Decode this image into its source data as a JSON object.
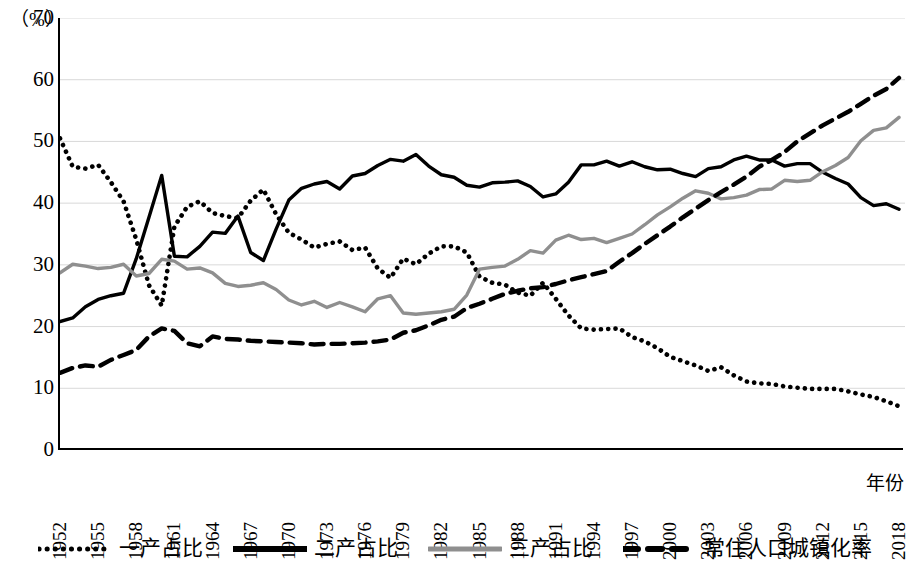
{
  "axis": {
    "unit_label": "（%）",
    "x_title": "年份",
    "y_ticks": [
      "0",
      "10",
      "20",
      "30",
      "40",
      "50",
      "60",
      "70"
    ],
    "x_ticks": [
      "1952",
      "1955",
      "1958",
      "1961",
      "1964",
      "1967",
      "1970",
      "1973",
      "1976",
      "1979",
      "1982",
      "1985",
      "1988",
      "1991",
      "1994",
      "1997",
      "2000",
      "2003",
      "2006",
      "2009",
      "2012",
      "2015",
      "2018"
    ]
  },
  "legend": {
    "items": [
      {
        "label": "一产占比",
        "style": "dotted",
        "color": "#000000"
      },
      {
        "label": "二产占比",
        "style": "solid",
        "color": "#000000"
      },
      {
        "label": "三产占比",
        "style": "solid",
        "color": "#8f8f8f"
      },
      {
        "label": "常住人口城镇化率",
        "style": "dashed",
        "color": "#000000"
      }
    ]
  },
  "chart_data": {
    "type": "line",
    "title": "",
    "xlabel": "年份",
    "ylabel": "（%）",
    "xlim": [
      1952,
      2018
    ],
    "ylim": [
      0,
      70
    ],
    "ytick_step": 10,
    "xtick_step": 3,
    "grid": true,
    "legend_position": "bottom",
    "x": [
      1952,
      1953,
      1954,
      1955,
      1956,
      1957,
      1958,
      1959,
      1960,
      1961,
      1962,
      1963,
      1964,
      1965,
      1966,
      1967,
      1968,
      1969,
      1970,
      1971,
      1972,
      1973,
      1974,
      1975,
      1976,
      1977,
      1978,
      1979,
      1980,
      1981,
      1982,
      1983,
      1984,
      1985,
      1986,
      1987,
      1988,
      1989,
      1990,
      1991,
      1992,
      1993,
      1994,
      1995,
      1996,
      1997,
      1998,
      1999,
      2000,
      2001,
      2002,
      2003,
      2004,
      2005,
      2006,
      2007,
      2008,
      2009,
      2010,
      2011,
      2012,
      2013,
      2014,
      2015,
      2016,
      2017,
      2018
    ],
    "series": [
      {
        "name": "一产占比",
        "style": "dotted",
        "color": "#000000",
        "values": [
          50.5,
          45.9,
          45.6,
          46.2,
          43.4,
          40.3,
          34.1,
          26.7,
          23.4,
          36.2,
          39.4,
          40.3,
          38.4,
          37.9,
          37.6,
          40.4,
          42.2,
          38.2,
          35.2,
          34.1,
          32.8,
          33.4,
          33.8,
          32.4,
          32.8,
          29.4,
          27.9,
          31.0,
          30.1,
          31.8,
          33.0,
          33.0,
          32.0,
          28.1,
          27.1,
          26.8,
          25.5,
          25.0,
          27.1,
          24.5,
          21.8,
          19.7,
          19.5,
          19.6,
          19.7,
          18.3,
          17.6,
          16.5,
          15.1,
          14.4,
          13.7,
          12.8,
          13.4,
          12.1,
          11.1,
          10.8,
          10.7,
          10.3,
          10.1,
          9.9,
          9.9,
          9.9,
          9.5,
          9.0,
          8.6,
          7.9,
          7.1
        ]
      },
      {
        "name": "二产占比",
        "style": "solid",
        "color": "#000000",
        "values": [
          20.8,
          21.4,
          23.2,
          24.4,
          25.0,
          25.4,
          31.0,
          37.7,
          44.5,
          31.4,
          31.3,
          33.0,
          35.3,
          35.1,
          37.9,
          32.0,
          30.7,
          35.8,
          40.5,
          42.4,
          43.1,
          43.5,
          42.3,
          44.4,
          44.8,
          46.1,
          47.1,
          46.8,
          47.9,
          46.0,
          44.6,
          44.2,
          42.9,
          42.6,
          43.3,
          43.4,
          43.6,
          42.7,
          41.0,
          41.5,
          43.4,
          46.2,
          46.2,
          46.8,
          46.0,
          46.7,
          45.9,
          45.4,
          45.5,
          44.8,
          44.3,
          45.6,
          45.9,
          47.0,
          47.6,
          47.0,
          47.0,
          46.0,
          46.4,
          46.4,
          45.0,
          44.0,
          43.1,
          40.9,
          39.6,
          39.9,
          39.0
        ]
      },
      {
        "name": "三产占比",
        "style": "solid",
        "color": "#8f8f8f",
        "values": [
          28.7,
          30.1,
          29.8,
          29.4,
          29.6,
          30.1,
          28.2,
          28.6,
          30.9,
          30.6,
          29.3,
          29.5,
          28.7,
          27.0,
          26.5,
          26.7,
          27.1,
          26.0,
          24.3,
          23.5,
          24.1,
          23.1,
          23.9,
          23.2,
          22.4,
          24.5,
          25.0,
          22.2,
          22.0,
          22.2,
          22.4,
          22.8,
          25.1,
          29.3,
          29.6,
          29.8,
          30.9,
          32.3,
          31.9,
          34.0,
          34.8,
          34.1,
          34.3,
          33.6,
          34.3,
          35.0,
          36.5,
          38.1,
          39.4,
          40.8,
          42.0,
          41.6,
          40.7,
          40.9,
          41.3,
          42.2,
          42.3,
          43.7,
          43.5,
          43.7,
          45.1,
          46.1,
          47.4,
          50.1,
          51.8,
          52.2,
          53.9
        ]
      },
      {
        "name": "常住人口城镇化率",
        "style": "dashed",
        "color": "#000000",
        "values": [
          12.5,
          13.3,
          13.7,
          13.5,
          14.6,
          15.4,
          16.2,
          18.4,
          19.7,
          19.3,
          17.3,
          16.8,
          18.4,
          18.0,
          17.9,
          17.7,
          17.6,
          17.5,
          17.4,
          17.3,
          17.1,
          17.2,
          17.2,
          17.3,
          17.4,
          17.6,
          17.9,
          19.0,
          19.4,
          20.2,
          21.1,
          21.6,
          23.0,
          23.7,
          24.5,
          25.3,
          25.8,
          26.2,
          26.4,
          26.9,
          27.5,
          28.0,
          28.5,
          29.0,
          30.5,
          31.9,
          33.4,
          34.8,
          36.2,
          37.7,
          39.1,
          40.5,
          41.8,
          43.0,
          44.3,
          45.9,
          47.0,
          48.3,
          50.0,
          51.3,
          52.6,
          53.7,
          54.8,
          56.1,
          57.4,
          58.5,
          60.3
        ]
      }
    ]
  }
}
